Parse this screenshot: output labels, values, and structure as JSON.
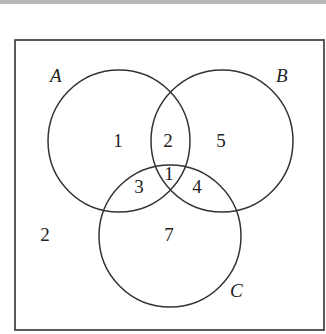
{
  "diagram": {
    "type": "venn",
    "sets": [
      {
        "name": "A",
        "cx": 119,
        "cy": 141,
        "r": 71,
        "label_x": 50,
        "label_y": 82
      },
      {
        "name": "B",
        "cx": 222,
        "cy": 141,
        "r": 71,
        "label_x": 276,
        "label_y": 82
      },
      {
        "name": "C",
        "cx": 170,
        "cy": 236,
        "r": 71,
        "label_x": 230,
        "label_y": 297
      }
    ],
    "regions": [
      {
        "id": "A_only",
        "value": "1",
        "x": 118,
        "y": 147
      },
      {
        "id": "A_and_B_only",
        "value": "2",
        "x": 168,
        "y": 147
      },
      {
        "id": "B_only",
        "value": "5",
        "x": 221,
        "y": 147
      },
      {
        "id": "A_and_B_and_C",
        "value": "1",
        "x": 169,
        "y": 180
      },
      {
        "id": "A_and_C_only",
        "value": "3",
        "x": 139,
        "y": 193
      },
      {
        "id": "B_and_C_only",
        "value": "4",
        "x": 197,
        "y": 193
      },
      {
        "id": "C_only",
        "value": "7",
        "x": 169,
        "y": 241
      },
      {
        "id": "outside",
        "value": "2",
        "x": 45,
        "y": 241
      }
    ],
    "frame": {
      "x": 15,
      "y": 40,
      "w": 309,
      "h": 290
    }
  }
}
